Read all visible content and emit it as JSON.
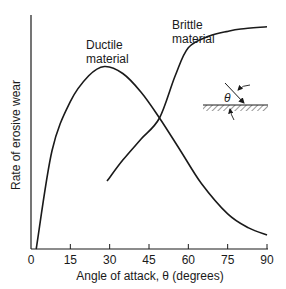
{
  "chart_data": {
    "type": "line",
    "title": "",
    "xlabel": "Angle of attack, θ (degrees)",
    "ylabel": "Rate of erosive wear",
    "xlim": [
      0,
      90
    ],
    "ylim": [
      0,
      1
    ],
    "xticks": [
      0,
      15,
      30,
      45,
      60,
      75,
      90
    ],
    "yticks": [],
    "grid": false,
    "legend": "inline labels",
    "series": [
      {
        "name": "Ductile material",
        "label_lines": [
          "Ductile",
          "material"
        ],
        "x": [
          2,
          8,
          15,
          22,
          28,
          35,
          42,
          49,
          57,
          65,
          75,
          83,
          90
        ],
        "y": [
          0.0,
          0.42,
          0.63,
          0.74,
          0.78,
          0.75,
          0.67,
          0.56,
          0.42,
          0.28,
          0.15,
          0.09,
          0.06
        ]
      },
      {
        "name": "Brittle material",
        "label_lines": [
          "Brittle",
          "material"
        ],
        "x": [
          29,
          35,
          42,
          49,
          55,
          60,
          68,
          75,
          80,
          90
        ],
        "y": [
          0.29,
          0.38,
          0.47,
          0.56,
          0.74,
          0.86,
          0.91,
          0.93,
          0.94,
          0.95
        ]
      }
    ],
    "annotations": [
      {
        "type": "inset-diagram",
        "description": "particle impinging on hatched surface at angle θ",
        "symbol": "θ"
      }
    ]
  }
}
